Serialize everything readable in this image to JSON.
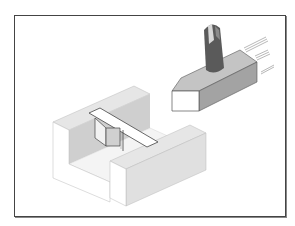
{
  "figure": {
    "description": "Isometric illustration of a cutting tool above a U-channel workpiece with a slot and inserted key",
    "elements": [
      {
        "name": "cutting-tool",
        "label": "Milling cutter shank with tool block"
      },
      {
        "name": "workpiece",
        "label": "U-shaped channel block"
      },
      {
        "name": "key-insert",
        "label": "Rectangular bar and key inside channel"
      },
      {
        "name": "motion-lines",
        "label": "Motion lines indicating movement"
      }
    ]
  },
  "colors": {
    "frame": "#444444",
    "light_face": "#ececec",
    "mid_face": "#d4d4d4",
    "dark_face": "#b5b5b5",
    "tool_top": "#bfbfbf",
    "tool_side": "#9a9a9a",
    "shank": "#555555",
    "edge": "#555555",
    "white": "#ffffff"
  }
}
